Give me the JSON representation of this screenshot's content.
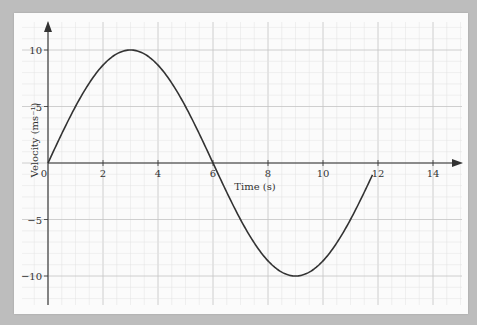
{
  "chart_data": {
    "type": "line",
    "title": "",
    "xlabel": "Time (s)",
    "ylabel": "Velocity (ms⁻¹)",
    "xlim": [
      0,
      15
    ],
    "ylim": [
      -12.5,
      12
    ],
    "x_ticks": [
      0,
      2,
      4,
      6,
      8,
      10,
      12,
      14
    ],
    "x_tick_labels": [
      "0",
      "2",
      "4",
      "6",
      "8",
      "10",
      "12",
      "14"
    ],
    "y_ticks": [
      10,
      5,
      -5,
      -10
    ],
    "y_tick_labels": [
      "10",
      "5",
      "−5",
      "−10"
    ],
    "grid": true,
    "legend": null,
    "series": [
      {
        "name": "velocity",
        "function": "v = 10·sin(πt/6)",
        "x": [
          0,
          1,
          2,
          3,
          4,
          5,
          6,
          7,
          8,
          9,
          10,
          11,
          11.8
        ],
        "values": [
          0,
          5,
          8.66,
          10,
          8.66,
          5,
          0,
          -5,
          -8.66,
          -10,
          -8.66,
          -5,
          -1.04
        ]
      }
    ]
  },
  "colors": {
    "background": "#bdbdbd",
    "paper": "#fbfbfb",
    "grid_minor": "#e2e2e2",
    "grid_major": "#c4c4c4",
    "axis": "#333333",
    "curve": "#333333"
  }
}
